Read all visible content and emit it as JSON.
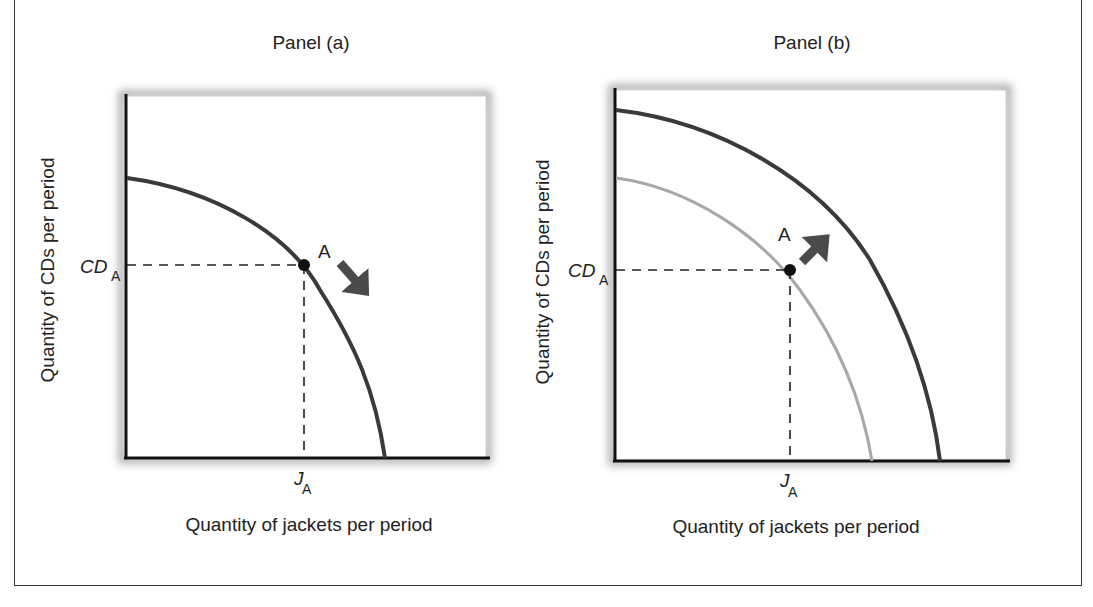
{
  "figure": {
    "panels": [
      {
        "title": "Panel (a)",
        "ylabel": "Quantity of CDs per period",
        "xlabel": "Quantity of jackets per period",
        "y_marker": {
          "main": "CD",
          "sub": "A"
        },
        "x_marker": {
          "main": "J",
          "sub": "A"
        },
        "point_label": "A",
        "arrow_direction": "down-right (movement along curve)"
      },
      {
        "title": "Panel (b)",
        "ylabel": "Quantity of CDs per period",
        "xlabel": "Quantity of jackets per period",
        "y_marker": {
          "main": "CD",
          "sub": "A"
        },
        "x_marker": {
          "main": "J",
          "sub": "A"
        },
        "point_label": "A",
        "arrow_direction": "up-right (curve shifts outward)"
      }
    ],
    "colors": {
      "curve": "#3a3a3a",
      "old_curve": "#a8a8a8",
      "axis": "#111111",
      "arrow": "#4a4a4a",
      "shadow": "#9a9a9a"
    }
  }
}
